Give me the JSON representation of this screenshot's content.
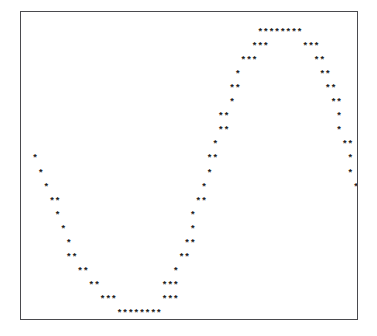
{
  "figure": {
    "name": "ascii-sine-wave-plot",
    "type": "ascii-scatter-plot",
    "background_color": "#ffffff",
    "border_color": "#4a4a4e",
    "marker_color": "#1c1c20",
    "marker_glyph": "*",
    "frame": {
      "left": 20,
      "top": 11,
      "width": 338,
      "height": 309
    },
    "grid": {
      "columns": 60,
      "rows": 22,
      "char_width": 5.63,
      "char_height": 14.05
    }
  },
  "chart_data": {
    "type": "scatter",
    "title": "",
    "subtitle": "",
    "xlabel": "",
    "ylabel": "",
    "xlim": [
      0,
      60
    ],
    "ylim": [
      0,
      22
    ],
    "grid": false,
    "legend": null,
    "marker": "*",
    "series": [
      {
        "name": "cos wave",
        "marker": "*",
        "points": [
          {
            "col": 2,
            "row": 10
          },
          {
            "col": 3,
            "row": 11
          },
          {
            "col": 4,
            "row": 12
          },
          {
            "col": 5,
            "row": 13
          },
          {
            "col": 6,
            "row": 13
          },
          {
            "col": 6,
            "row": 14
          },
          {
            "col": 7,
            "row": 15
          },
          {
            "col": 8,
            "row": 16
          },
          {
            "col": 8,
            "row": 17
          },
          {
            "col": 9,
            "row": 17
          },
          {
            "col": 10,
            "row": 18
          },
          {
            "col": 11,
            "row": 18
          },
          {
            "col": 12,
            "row": 19
          },
          {
            "col": 13,
            "row": 19
          },
          {
            "col": 14,
            "row": 20
          },
          {
            "col": 15,
            "row": 20
          },
          {
            "col": 16,
            "row": 20
          },
          {
            "col": 17,
            "row": 21
          },
          {
            "col": 18,
            "row": 21
          },
          {
            "col": 19,
            "row": 21
          },
          {
            "col": 20,
            "row": 21
          },
          {
            "col": 21,
            "row": 21
          },
          {
            "col": 22,
            "row": 21
          },
          {
            "col": 23,
            "row": 21
          },
          {
            "col": 24,
            "row": 21
          },
          {
            "col": 25,
            "row": 20
          },
          {
            "col": 26,
            "row": 20
          },
          {
            "col": 27,
            "row": 20
          },
          {
            "col": 25,
            "row": 19
          },
          {
            "col": 26,
            "row": 19
          },
          {
            "col": 27,
            "row": 19
          },
          {
            "col": 27,
            "row": 18
          },
          {
            "col": 28,
            "row": 17
          },
          {
            "col": 29,
            "row": 17
          },
          {
            "col": 29,
            "row": 16
          },
          {
            "col": 30,
            "row": 16
          },
          {
            "col": 30,
            "row": 15
          },
          {
            "col": 30,
            "row": 14
          },
          {
            "col": 31,
            "row": 13
          },
          {
            "col": 32,
            "row": 13
          },
          {
            "col": 32,
            "row": 12
          },
          {
            "col": 33,
            "row": 11
          },
          {
            "col": 33,
            "row": 10
          },
          {
            "col": 34,
            "row": 10
          },
          {
            "col": 34,
            "row": 9
          },
          {
            "col": 35,
            "row": 8
          },
          {
            "col": 36,
            "row": 8
          },
          {
            "col": 35,
            "row": 7
          },
          {
            "col": 36,
            "row": 7
          },
          {
            "col": 37,
            "row": 6
          },
          {
            "col": 37,
            "row": 5
          },
          {
            "col": 38,
            "row": 5
          },
          {
            "col": 38,
            "row": 4
          },
          {
            "col": 39,
            "row": 3
          },
          {
            "col": 40,
            "row": 3
          },
          {
            "col": 41,
            "row": 3
          },
          {
            "col": 41,
            "row": 2
          },
          {
            "col": 42,
            "row": 2
          },
          {
            "col": 43,
            "row": 2
          },
          {
            "col": 42,
            "row": 1
          },
          {
            "col": 43,
            "row": 1
          },
          {
            "col": 44,
            "row": 1
          },
          {
            "col": 45,
            "row": 1
          },
          {
            "col": 46,
            "row": 1
          },
          {
            "col": 47,
            "row": 1
          },
          {
            "col": 48,
            "row": 1
          },
          {
            "col": 49,
            "row": 1
          },
          {
            "col": 50,
            "row": 2
          },
          {
            "col": 51,
            "row": 2
          },
          {
            "col": 52,
            "row": 2
          },
          {
            "col": 52,
            "row": 3
          },
          {
            "col": 53,
            "row": 3
          },
          {
            "col": 53,
            "row": 4
          },
          {
            "col": 54,
            "row": 4
          },
          {
            "col": 54,
            "row": 5
          },
          {
            "col": 55,
            "row": 5
          },
          {
            "col": 55,
            "row": 6
          },
          {
            "col": 56,
            "row": 6
          },
          {
            "col": 56,
            "row": 7
          },
          {
            "col": 56,
            "row": 8
          },
          {
            "col": 57,
            "row": 9
          },
          {
            "col": 58,
            "row": 9
          },
          {
            "col": 58,
            "row": 10
          },
          {
            "col": 58,
            "row": 11
          },
          {
            "col": 59,
            "row": 12
          }
        ]
      }
    ],
    "rows": [
      "                                                            ",
      "                                          ********          ",
      "                                         ***      ***       ",
      "                                       ***          **      ",
      "                                      *              **     ",
      "                                     **               **    ",
      "                                    **                  **  ",
      "                                   *                      * ",
      "                                  *                       * ",
      "                                 **                        *",
      "  *                             **                          ",
      "   *                           *                           *",
      "    *                         *                            *",
      "     **                      **                             ",
      "       *                    **                              ",
      "        *                  *                                ",
      "         **               *                                 ",
      "          **            ***                                 ",
      "            **        ***                                   ",
      "             ***    ***                                     ",
      "               ********                                     ",
      "                                                            "
    ]
  }
}
